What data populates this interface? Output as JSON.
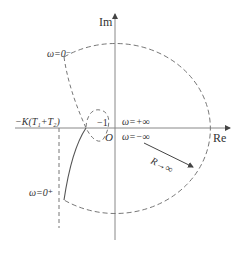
{
  "diagram": {
    "type": "nyquist-plot",
    "axes": {
      "im_label": "Im",
      "re_label": "Re",
      "origin_label": "O"
    },
    "labels": {
      "omega_zero_minus": "ω=0⁻",
      "omega_zero_plus": "ω=0⁺",
      "omega_plus_inf": "ω=+∞",
      "omega_minus_inf": "ω=−∞",
      "neg_one": "−1",
      "asymptote": "−K(T₁+T₂)",
      "radius": "R→∞"
    },
    "colors": {
      "axis": "#888888",
      "curve": "#555555",
      "text": "#333333"
    }
  }
}
